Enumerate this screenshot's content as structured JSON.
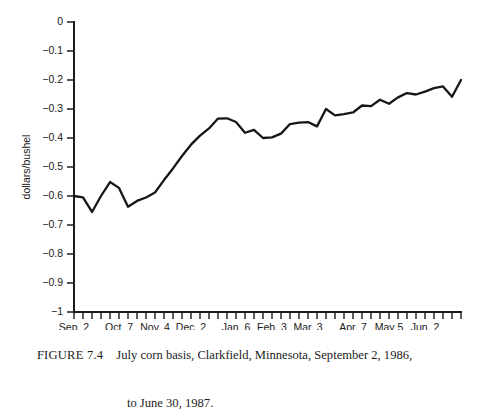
{
  "figure": {
    "number_label": "FIGURE 7.4",
    "caption_line_1": "July corn basis, Clarkfield, Minnesota, September 2, 1986,",
    "caption_line_2": "to June 30, 1987."
  },
  "chart_data": {
    "type": "line",
    "title": "",
    "xlabel": "",
    "ylabel": "dollars/bushel",
    "ylim": [
      -1,
      0
    ],
    "xlim": [
      0,
      43
    ],
    "grid": false,
    "legend": false,
    "ytick_labels": [
      "0",
      "−0.1",
      "−0.2",
      "−0.3",
      "−0.4",
      "−0.5",
      "−0.6",
      "−0.7",
      "−0.8",
      "−0.9",
      "−1"
    ],
    "ytick_values": [
      0,
      -0.1,
      -0.2,
      -0.3,
      -0.4,
      -0.5,
      -0.6,
      -0.7,
      -0.8,
      -0.9,
      -1
    ],
    "xtick_labels": [
      "Sep. 2",
      "Oct. 7",
      "Nov. 4",
      "Dec. 2",
      "Jan. 6",
      "Feb. 3",
      "Mar. 3",
      "Apr. 7",
      "May 5",
      "Jun. 2"
    ],
    "xtick_label_indices": [
      0,
      5,
      9,
      13,
      18,
      22,
      26,
      31,
      35,
      39
    ],
    "minor_tick_count": 44,
    "x": [
      0,
      1,
      2,
      3,
      4,
      5,
      6,
      7,
      8,
      9,
      10,
      11,
      12,
      13,
      14,
      15,
      16,
      17,
      18,
      19,
      20,
      21,
      22,
      23,
      24,
      25,
      26,
      27,
      28,
      29,
      30,
      31,
      32,
      33,
      34,
      35,
      36,
      37,
      38,
      39,
      40,
      41,
      42,
      43
    ],
    "values": [
      -0.6,
      -0.605,
      -0.655,
      -0.6,
      -0.552,
      -0.572,
      -0.637,
      -0.617,
      -0.605,
      -0.588,
      -0.545,
      -0.505,
      -0.462,
      -0.423,
      -0.392,
      -0.367,
      -0.333,
      -0.332,
      -0.345,
      -0.382,
      -0.372,
      -0.4,
      -0.398,
      -0.385,
      -0.352,
      -0.347,
      -0.345,
      -0.36,
      -0.3,
      -0.322,
      -0.318,
      -0.312,
      -0.288,
      -0.29,
      -0.268,
      -0.282,
      -0.26,
      -0.245,
      -0.25,
      -0.24,
      -0.228,
      -0.222,
      -0.258,
      -0.2
    ],
    "series_name": "July corn basis",
    "line_color": "#171717"
  }
}
